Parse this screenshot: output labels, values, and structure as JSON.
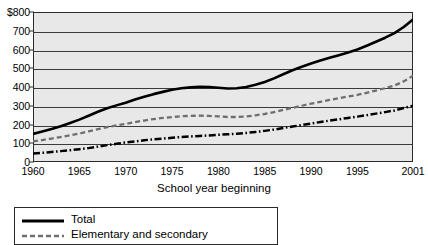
{
  "chart_data": {
    "type": "line",
    "title": "",
    "xlabel": "School year beginning",
    "ylabel": "",
    "grid": true,
    "legend_position": "bottom-left",
    "xlim": [
      1960,
      2001
    ],
    "ylim": [
      0,
      800
    ],
    "ytick_labels": [
      "$800",
      "700",
      "600",
      "500",
      "400",
      "300",
      "200",
      "100",
      "0"
    ],
    "ytick_values": [
      800,
      700,
      600,
      500,
      400,
      300,
      200,
      100,
      0
    ],
    "xtick_labels": [
      "1960",
      "1965",
      "1970",
      "1975",
      "1980",
      "1985",
      "1990",
      "1995",
      "2001"
    ],
    "xtick_values": [
      1960,
      1965,
      1970,
      1975,
      1980,
      1985,
      1990,
      1995,
      2001
    ],
    "x": [
      1960,
      1961,
      1962,
      1963,
      1964,
      1965,
      1966,
      1967,
      1968,
      1969,
      1970,
      1971,
      1972,
      1973,
      1974,
      1975,
      1976,
      1977,
      1978,
      1979,
      1980,
      1981,
      1982,
      1983,
      1984,
      1985,
      1986,
      1987,
      1988,
      1989,
      1990,
      1991,
      1992,
      1993,
      1994,
      1995,
      1996,
      1997,
      1998,
      1999,
      2000,
      2001
    ],
    "series": [
      {
        "name": "Total",
        "style": "solid",
        "color": "#000000",
        "values": [
          150,
          163,
          176,
          191,
          208,
          226,
          247,
          268,
          287,
          302,
          316,
          333,
          348,
          362,
          374,
          385,
          393,
          398,
          401,
          400,
          396,
          392,
          393,
          400,
          412,
          427,
          446,
          468,
          489,
          508,
          525,
          541,
          556,
          570,
          584,
          600,
          620,
          641,
          663,
          687,
          720,
          760
        ]
      },
      {
        "name": "Elementary and secondary",
        "style": "dashed",
        "color": "#6f6f6f",
        "values": [
          110,
          117,
          125,
          133,
          142,
          152,
          163,
          175,
          186,
          195,
          203,
          213,
          221,
          229,
          235,
          240,
          244,
          246,
          247,
          246,
          243,
          240,
          240,
          243,
          249,
          256,
          266,
          278,
          289,
          300,
          311,
          321,
          331,
          340,
          349,
          358,
          369,
          381,
          394,
          408,
          430,
          460
        ]
      },
      {
        "name": "",
        "style": "dashdot",
        "color": "#000000",
        "values": [
          45,
          49,
          53,
          58,
          63,
          68,
          74,
          82,
          90,
          97,
          104,
          110,
          116,
          121,
          125,
          129,
          133,
          136,
          139,
          142,
          145,
          148,
          151,
          155,
          160,
          166,
          173,
          181,
          189,
          197,
          205,
          213,
          221,
          228,
          235,
          242,
          250,
          258,
          266,
          275,
          288,
          300
        ]
      }
    ]
  },
  "legend": {
    "entries": [
      {
        "label": "Total",
        "style": "solid"
      },
      {
        "label": "Elementary and secondary",
        "style": "dashed"
      }
    ]
  }
}
